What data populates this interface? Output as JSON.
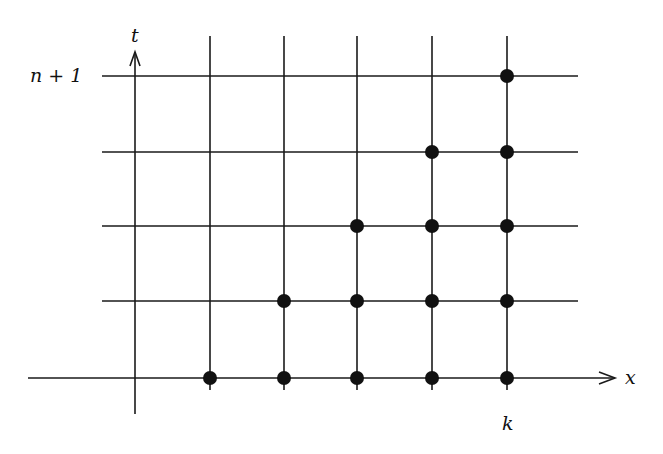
{
  "diagram": {
    "title": "",
    "stroke_color": "#1a1a1a",
    "dot_color": "#111111",
    "axes": {
      "x": {
        "label": "x",
        "from": [
          28,
          378
        ],
        "to": [
          615,
          378
        ]
      },
      "t": {
        "label": "t",
        "from": [
          135,
          414
        ],
        "to": [
          135,
          52
        ]
      }
    },
    "labels": {
      "t_axis": "t",
      "x_axis": "x",
      "top_level": "n + 1",
      "column_k": "k"
    },
    "grid": {
      "columns_x": [
        135,
        210,
        284,
        357,
        432,
        507
      ],
      "rows_y": [
        76,
        152,
        226,
        301
      ],
      "vertical_top": 36,
      "vertical_bottom": 390,
      "horizontal_left": 102,
      "horizontal_right": 578
    },
    "dots": [
      {
        "x": 210,
        "y": 378
      },
      {
        "x": 284,
        "y": 378
      },
      {
        "x": 357,
        "y": 378
      },
      {
        "x": 432,
        "y": 378
      },
      {
        "x": 507,
        "y": 378
      },
      {
        "x": 284,
        "y": 301
      },
      {
        "x": 357,
        "y": 301
      },
      {
        "x": 432,
        "y": 301
      },
      {
        "x": 507,
        "y": 301
      },
      {
        "x": 357,
        "y": 226
      },
      {
        "x": 432,
        "y": 226
      },
      {
        "x": 507,
        "y": 226
      },
      {
        "x": 432,
        "y": 152
      },
      {
        "x": 507,
        "y": 152
      },
      {
        "x": 507,
        "y": 76
      }
    ],
    "dot_radius": 7
  }
}
